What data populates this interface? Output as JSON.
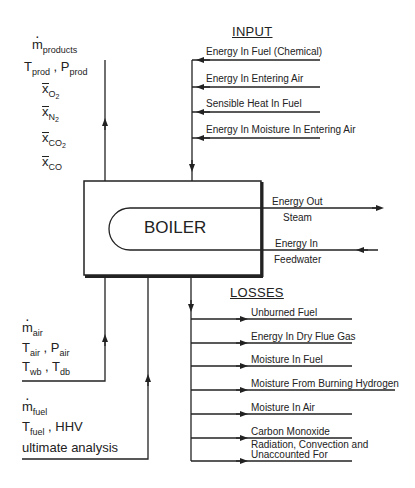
{
  "diagram": {
    "center": {
      "label": "BOILER"
    },
    "input_section": {
      "heading": "INPUT",
      "items": [
        "Energy In Fuel  (Chemical)",
        "Energy In Entering Air",
        "Sensible Heat In Fuel",
        "Energy In Moisture In Entering Air"
      ]
    },
    "steam": {
      "label_top": "Energy Out",
      "label_bottom": "Steam"
    },
    "feedwater": {
      "label_top": "Energy In",
      "label_bottom": "Feedwater"
    },
    "losses_section": {
      "heading": "LOSSES",
      "items": [
        "Unburned Fuel",
        "Energy In Dry Flue Gas",
        "Moisture In Fuel",
        "Moisture From Burning Hydrogen",
        "Moisture In  Air",
        "Carbon Monoxide",
        "Radiation, Convection and",
        "Unaccounted For"
      ]
    },
    "products": {
      "m": "m",
      "m_sub": "products",
      "t": "T",
      "t_sub": "prod",
      "sep": " , ",
      "p": "P",
      "p_sub": "prod",
      "x": "x",
      "x_o2": "O",
      "x_o2_sub": "2",
      "x_n2": "N",
      "x_n2_sub": "2",
      "x_co2": "CO",
      "x_co2_sub": "2",
      "x_co": "CO"
    },
    "air": {
      "m": "m",
      "m_sub": "air",
      "t": "T",
      "t_sub": "air",
      "sep": "  , ",
      "p": "P",
      "p_sub": "air",
      "twb": "T",
      "twb_sub": "wb",
      "tdb": "T",
      "tdb_sub": "db"
    },
    "fuel": {
      "m": "m",
      "m_sub": "fuel",
      "t": "T",
      "t_sub": "fuel",
      "sep": " , ",
      "hhv": "HHV",
      "analysis": "ultimate analysis"
    }
  }
}
